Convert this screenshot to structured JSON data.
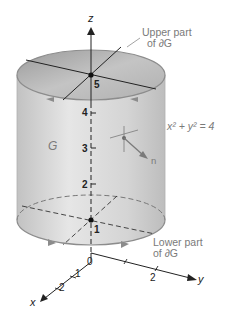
{
  "figure": {
    "axes": {
      "z_label": "z",
      "y_label": "y",
      "x_label": "x",
      "origin_label": "0"
    },
    "z_ticks": [
      "1",
      "2",
      "3",
      "4",
      "5"
    ],
    "y_ticks": [
      "2"
    ],
    "x_ticks": [
      "1",
      "2"
    ],
    "labels": {
      "region": "G",
      "upper_line1": "Upper part",
      "upper_line2": "of ∂G",
      "lower_line1": "Lower part",
      "lower_line2": "of ∂G",
      "equation": "x² + y² = 4",
      "normal": "n"
    },
    "colors": {
      "cylinder_fill": "#d6d6d6",
      "top_fill": "#a9a9a9",
      "edge": "#8c8c8c",
      "label_gray": "#7a7a7a",
      "axis": "#222222"
    }
  }
}
